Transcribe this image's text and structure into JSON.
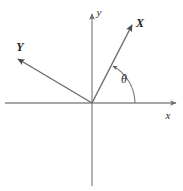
{
  "figure": {
    "type": "coordinate-axes-rotation-diagram",
    "background_color": "#ffffff",
    "line_color": "#8a8a8a",
    "text_color": "#2b2b2b",
    "width": 183,
    "height": 191
  },
  "axes": {
    "origin": {
      "x": 92,
      "y": 103
    },
    "x_axis": {
      "label": "x",
      "start": {
        "x": 5,
        "y": 103
      },
      "end": {
        "x": 178,
        "y": 103
      },
      "label_position": {
        "x": 168,
        "y": 118
      },
      "arrow": "right"
    },
    "y_axis": {
      "label": "y",
      "start": {
        "x": 92,
        "y": 186
      },
      "end": {
        "x": 92,
        "y": 12
      },
      "label_position": {
        "x": 97,
        "y": 14
      },
      "arrow": "up"
    }
  },
  "rays": [
    {
      "label": "X",
      "name": "rotated-x-axis",
      "from": {
        "x": 92,
        "y": 103
      },
      "to": {
        "x": 134,
        "y": 22
      },
      "label_position": {
        "x": 139,
        "y": 26
      },
      "angle_degrees": 62.6,
      "arrow": "end"
    },
    {
      "label": "Y",
      "name": "rotated-y-axis",
      "from": {
        "x": 92,
        "y": 103
      },
      "to": {
        "x": 15,
        "y": 57
      },
      "label_position": {
        "x": 16,
        "y": 50
      },
      "angle_degrees": 149.2,
      "arrow": "end"
    }
  ],
  "angle_arc": {
    "symbol": "θ",
    "label_position": {
      "x": 121,
      "y": 82
    },
    "radius": 43,
    "start_angle_degrees": 0,
    "end_angle_degrees": 62.6,
    "arrow": "end"
  }
}
